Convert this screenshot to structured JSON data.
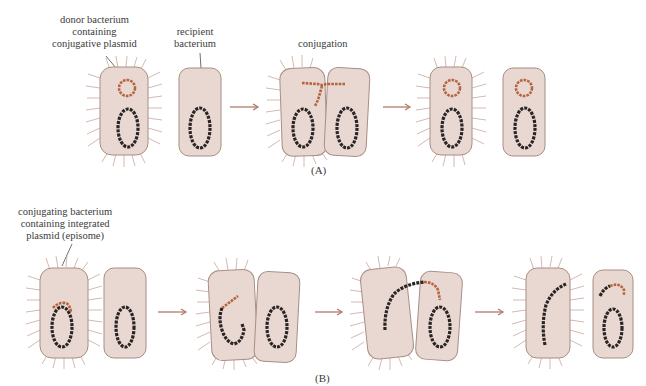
{
  "colors": {
    "cell_fill": "#e8d8d1",
    "cell_stroke": "#a88e84",
    "pili": "#caa79a",
    "chromosome": "#2a2424",
    "plasmid": "#b5643f",
    "arrow": "#b07a6a"
  },
  "panel_a": {
    "label": "(A)",
    "annotations": {
      "donor": [
        "donor bacterium",
        "containing",
        "conjugative plasmid"
      ],
      "recipient": [
        "recipient",
        "bacterium"
      ],
      "conjugation": "conjugation"
    }
  },
  "panel_b": {
    "label": "(B)",
    "annotations": {
      "conjugating": [
        "conjugating bacterium",
        "containing integrated",
        "plasmid (episome)"
      ]
    }
  }
}
